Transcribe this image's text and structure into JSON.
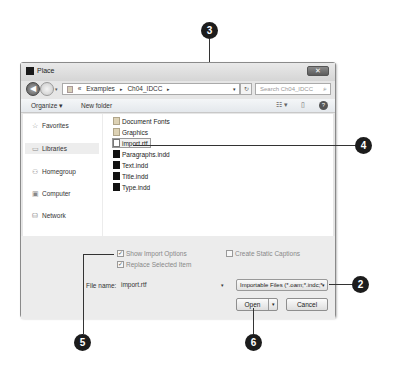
{
  "dialog": {
    "title": "Place",
    "close_label": "✕",
    "address": {
      "prefix": "«",
      "segments": [
        "Examples",
        "Ch04_IDCC"
      ],
      "separator": "▸",
      "dropdown_glyph": "▾"
    },
    "refresh_glyph": "↻",
    "search_placeholder": "Search Ch04_IDCC",
    "search_glyph": "⌕",
    "toolbar": {
      "organize_label": "Organize ▾",
      "new_folder_label": "New folder",
      "views_glyph": "☷ ▾",
      "preview_glyph": "▯",
      "help_glyph": "?"
    },
    "nav_pane": [
      {
        "label": "Favorites",
        "icon": "☆"
      },
      {
        "label": "Libraries",
        "icon": "▭"
      },
      {
        "label": "Homegroup",
        "icon": "⚇"
      },
      {
        "label": "Computer",
        "icon": "▣"
      },
      {
        "label": "Network",
        "icon": "⛁"
      }
    ],
    "files": [
      {
        "name": "Document Fonts",
        "type": "folder"
      },
      {
        "name": "Graphics",
        "type": "folder"
      },
      {
        "name": "import.rtf",
        "type": "rtf"
      },
      {
        "name": "Paragraphs.indd",
        "type": "indd"
      },
      {
        "name": "Text.indd",
        "type": "indd"
      },
      {
        "name": "Title.indd",
        "type": "indd"
      },
      {
        "name": "Type.indd",
        "type": "indd"
      }
    ],
    "options": {
      "show_import_options": {
        "label": "Show Import Options",
        "checked": true
      },
      "replace_selected_item": {
        "label": "Replace Selected Item",
        "checked": true
      },
      "create_static_captions": {
        "label": "Create Static Captions",
        "checked": false
      },
      "check_glyph": "✓"
    },
    "file_name_label": "File name:",
    "file_name_value": "import.rtf",
    "file_type_value": "Importable Files (*.oam;*.indc;*",
    "open_label": "Open",
    "cancel_label": "Cancel",
    "dropdown_glyph": "▾"
  },
  "callouts": [
    "2",
    "3",
    "4",
    "5",
    "6"
  ]
}
